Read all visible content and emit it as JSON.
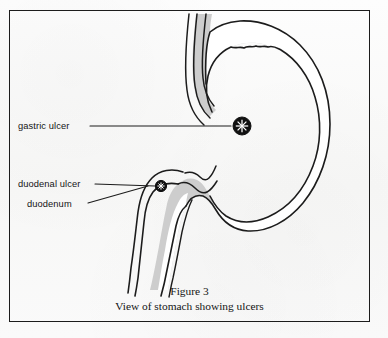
{
  "figure": {
    "caption_number": "Figure 3",
    "caption_title": "View of stomach showing ulcers",
    "frame_color": "#1c1c1c",
    "background_color": "#fbfbfb"
  },
  "labels": {
    "gastric_ulcer": "gastric ulcer",
    "duodenal_ulcer": "duodenal ulcer",
    "duodenum": "duodenum"
  },
  "anatomy": {
    "organ_fill_color": "#cdcdcd",
    "outline_color": "#1c1c1c",
    "lumen_color": "#ffffff",
    "parts": [
      "esophagus",
      "fundus",
      "stomach-body",
      "greater-curvature",
      "lesser-curvature",
      "antrum",
      "pylorus",
      "duodenum"
    ]
  },
  "markers": {
    "gastric_ulcer_marker": "starburst-ulcer-icon",
    "duodenal_ulcer_marker": "starburst-ulcer-icon"
  }
}
